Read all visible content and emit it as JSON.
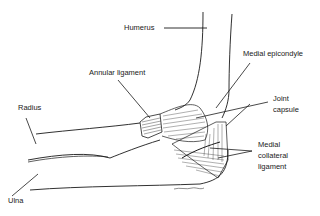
{
  "diagram": {
    "labels": {
      "humerus": "Humerus",
      "medial_epicondyle": "Medial epicondyle",
      "annular_ligament": "Annular ligament",
      "joint_capsule_line1": "Joint",
      "joint_capsule_line2": "capsule",
      "radius": "Radius",
      "mcl_line1": "Medial",
      "mcl_line2": "collateral",
      "mcl_line3": "ligament",
      "ulna": "Ulna"
    },
    "colors": {
      "ink": "#1a1a1a",
      "background": "#ffffff"
    }
  }
}
